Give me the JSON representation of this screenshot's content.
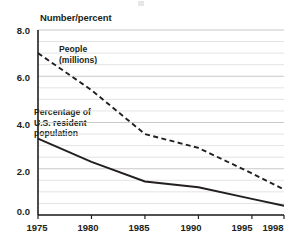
{
  "chart_data": {
    "type": "line",
    "title": "",
    "xlabel": "",
    "ylabel": "Number/percent",
    "x": [
      1975,
      1980,
      1985,
      1990,
      1995,
      1998
    ],
    "xlim": [
      1975,
      1998
    ],
    "ylim": [
      0.0,
      8.0
    ],
    "ytick_labels": [
      "0.0",
      "2.0",
      "4.0",
      "6.0",
      "8.0"
    ],
    "ytick_values": [
      0.0,
      2.0,
      4.0,
      6.0,
      8.0
    ],
    "xtick_labels": [
      "1975",
      "1980",
      "1985",
      "1990",
      "1995",
      "1998"
    ],
    "xtick_values": [
      1975,
      1980,
      1985,
      1990,
      1995,
      1998
    ],
    "grid": "horizontal-minor-0.5",
    "legend_position": "inline-annotations",
    "series": [
      {
        "name": "People (millions)",
        "style": "dashed",
        "color": "#231f20",
        "values": [
          7.0,
          5.4,
          3.5,
          2.9,
          1.8,
          1.1
        ]
      },
      {
        "name": "Percentage of U.S. resident population",
        "style": "solid",
        "color": "#231f20",
        "values": [
          3.3,
          2.3,
          1.45,
          1.2,
          0.7,
          0.4
        ]
      }
    ],
    "annotations": [
      {
        "name": "people-annotation",
        "lines": [
          "People",
          "(millions)"
        ]
      },
      {
        "name": "percentage-annotation",
        "lines": [
          "Percentage of",
          "U.S. resident",
          "population"
        ]
      }
    ]
  }
}
